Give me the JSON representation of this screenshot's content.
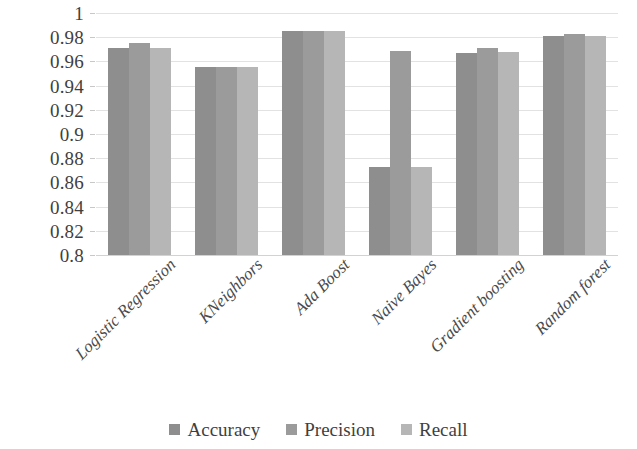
{
  "chart_data": {
    "type": "bar",
    "title": "",
    "subtitle": "",
    "xlabel": "",
    "ylabel": "",
    "ylim": [
      0.8,
      1
    ],
    "ytick_step": 0.02,
    "ytick_labels": [
      "1",
      "0.98",
      "0.96",
      "0.94",
      "0.92",
      "0.9",
      "0.88",
      "0.86",
      "0.84",
      "0.82",
      "0.8"
    ],
    "ytick_values": [
      1,
      0.98,
      0.96,
      0.94,
      0.92,
      0.9,
      0.88,
      0.86,
      0.84,
      0.82,
      0.8
    ],
    "grid": true,
    "grid_axis": "y",
    "legend_position": "bottom",
    "categories": [
      "Logistic Regression",
      "KNeighbors",
      "Ada Boost",
      "Naive Bayes",
      "Gradient boosting",
      "Random forest"
    ],
    "series": [
      {
        "name": "Accuracy",
        "color": "#8e8e8e",
        "values": [
          0.971,
          0.955,
          0.985,
          0.873,
          0.967,
          0.981
        ]
      },
      {
        "name": "Precision",
        "color": "#9b9b9b",
        "values": [
          0.975,
          0.955,
          0.985,
          0.969,
          0.971,
          0.983
        ]
      },
      {
        "name": "Recall",
        "color": "#b6b6b6",
        "values": [
          0.971,
          0.955,
          0.985,
          0.873,
          0.968,
          0.981
        ]
      }
    ]
  },
  "legend": {
    "items": [
      {
        "label": "Accuracy",
        "color": "#8e8e8e",
        "swatch": "square-swatch"
      },
      {
        "label": "Precision",
        "color": "#9b9b9b",
        "swatch": "square-swatch"
      },
      {
        "label": "Recall",
        "color": "#b6b6b6",
        "swatch": "square-swatch"
      }
    ]
  }
}
